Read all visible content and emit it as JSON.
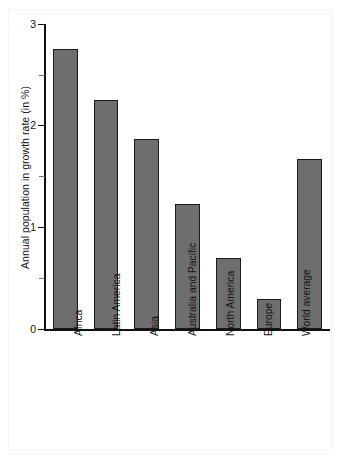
{
  "chart_data": {
    "type": "bar",
    "title": "",
    "subtitle": "",
    "xlabel": "",
    "ylabel": "Annual population in growth rate (in %)",
    "categories": [
      "Africa",
      "Latin America",
      "Asia",
      "Australia and Pacific",
      "North America",
      "Europe",
      "World average"
    ],
    "values": [
      2.75,
      2.25,
      1.87,
      1.23,
      0.7,
      0.3,
      1.67
    ],
    "ylim": [
      0,
      3
    ],
    "yticks": [
      0,
      1,
      2,
      3
    ],
    "ytick_labels": [
      "0",
      "1",
      "2",
      "3"
    ],
    "yminor_ticks": [
      0.5,
      1.5,
      2.5
    ],
    "grid": false,
    "legend": null,
    "annotations": [],
    "series": [
      {
        "name": "Annual population growth rate",
        "values": [
          2.75,
          2.25,
          1.87,
          1.23,
          0.7,
          0.3,
          1.67
        ]
      }
    ]
  },
  "style": {
    "bar_fill": "#6e6e6e",
    "bar_edge": "#1b1b1b",
    "axis_color": "#111111",
    "text_color": "#141414",
    "background": "#ffffff",
    "frame_color": "#f4f4f4"
  }
}
